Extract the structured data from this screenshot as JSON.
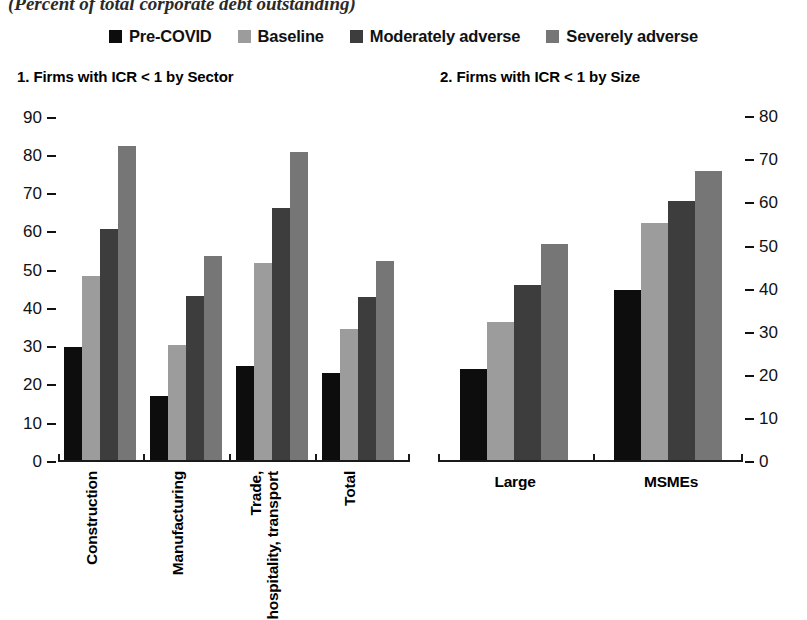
{
  "suptitle": "(Percent of total corporate debt outstanding)",
  "legend": {
    "items": [
      {
        "label": "Pre-COVID",
        "color": "#0d0d0d"
      },
      {
        "label": "Baseline",
        "color": "#9c9c9c"
      },
      {
        "label": "Moderately adverse",
        "color": "#3d3d3d"
      },
      {
        "label": "Severely adverse",
        "color": "#767676"
      }
    ]
  },
  "panels": [
    {
      "title": "1. Firms with ICR < 1 by Sector"
    },
    {
      "title": "2. Firms with ICR < 1 by Size"
    }
  ],
  "chart_data": [
    {
      "type": "bar",
      "title": "1. Firms with ICR < 1 by Sector",
      "suptitle": "(Percent of total corporate debt outstanding)",
      "xlabel": "",
      "ylabel": "",
      "ylim": [
        0,
        92
      ],
      "yticks": [
        0,
        10,
        20,
        30,
        40,
        50,
        60,
        70,
        80,
        90
      ],
      "ytick_labels": [
        "0",
        "10",
        "20",
        "30",
        "40",
        "50",
        "60",
        "70",
        "80",
        "90"
      ],
      "axis_side": "left",
      "grid": false,
      "legend_position": "top-center",
      "categories": [
        "Construction",
        "Manufacturing",
        "Trade, hospitality, transport",
        "Total"
      ],
      "series": [
        {
          "name": "Pre-COVID",
          "color": "#0d0d0d",
          "values": [
            30.0,
            17.2,
            25.0,
            23.2
          ]
        },
        {
          "name": "Baseline",
          "color": "#9c9c9c",
          "values": [
            48.7,
            30.6,
            52.0,
            34.8
          ]
        },
        {
          "name": "Moderately adverse",
          "color": "#3d3d3d",
          "values": [
            61.0,
            43.4,
            66.5,
            43.2
          ]
        },
        {
          "name": "Severely adverse",
          "color": "#767676",
          "values": [
            82.5,
            53.8,
            81.0,
            52.5
          ]
        }
      ]
    },
    {
      "type": "bar",
      "title": "2. Firms with ICR < 1 by Size",
      "xlabel": "",
      "ylabel": "",
      "ylim": [
        0,
        81.7
      ],
      "yticks": [
        0,
        10,
        20,
        30,
        40,
        50,
        60,
        70,
        80
      ],
      "ytick_labels": [
        "0",
        "10",
        "20",
        "30",
        "40",
        "50",
        "60",
        "70",
        "80"
      ],
      "axis_side": "right",
      "grid": false,
      "legend_position": "top-center",
      "categories": [
        "Large",
        "MSMEs"
      ],
      "series": [
        {
          "name": "Pre-COVID",
          "color": "#0d0d0d",
          "values": [
            21.5,
            40.0
          ]
        },
        {
          "name": "Baseline",
          "color": "#9c9c9c",
          "values": [
            32.5,
            55.5
          ]
        },
        {
          "name": "Moderately adverse",
          "color": "#3d3d3d",
          "values": [
            41.0,
            60.5
          ]
        },
        {
          "name": "Severely adverse",
          "color": "#767676",
          "values": [
            50.5,
            67.5
          ]
        }
      ]
    }
  ]
}
